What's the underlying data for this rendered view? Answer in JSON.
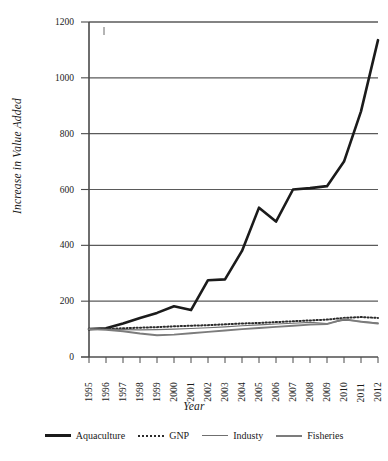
{
  "chart_data": {
    "type": "line",
    "title": "",
    "xlabel": "Year",
    "ylabel": "Increase in Value Added",
    "categories": [
      "1995",
      "1996",
      "1997",
      "1998",
      "1999",
      "2000",
      "2001",
      "2002",
      "2003",
      "2004",
      "2005",
      "2006",
      "2007",
      "2008",
      "2009",
      "2010",
      "2011",
      "2012"
    ],
    "ylim": [
      0,
      1200
    ],
    "yticks": [
      0,
      200,
      400,
      600,
      800,
      1000,
      1200
    ],
    "grid": true,
    "legend_position": "bottom",
    "series": [
      {
        "name": "Aquaculture",
        "style": "solid-thick",
        "color": "#1b1b1b",
        "values": [
          100,
          103,
          120,
          140,
          158,
          182,
          168,
          275,
          278,
          380,
          535,
          485,
          600,
          605,
          612,
          700,
          880,
          1135
        ]
      },
      {
        "name": "GNP",
        "style": "dotted",
        "color": "#2b2b2b",
        "values": [
          100,
          100,
          103,
          105,
          107,
          110,
          112,
          114,
          117,
          120,
          122,
          125,
          128,
          131,
          134,
          140,
          143,
          140
        ]
      },
      {
        "name": "Industy",
        "style": "solid-thin",
        "color": "#6f6f6f",
        "values": [
          100,
          99,
          98,
          97,
          98,
          100,
          102,
          105,
          108,
          112,
          115,
          118,
          121,
          124,
          120,
          132,
          128,
          122
        ]
      },
      {
        "name": "Fisheries",
        "style": "solid-medium",
        "color": "#7c7c7c",
        "values": [
          100,
          97,
          92,
          84,
          78,
          80,
          85,
          90,
          95,
          100,
          104,
          108,
          112,
          116,
          118,
          136,
          126,
          120
        ]
      }
    ]
  },
  "legend": {
    "items": [
      {
        "label": "Aquaculture"
      },
      {
        "label": "GNP"
      },
      {
        "label": "Industy"
      },
      {
        "label": "Fisheries"
      }
    ]
  }
}
